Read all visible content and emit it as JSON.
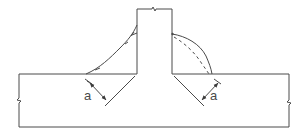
{
  "diagram": {
    "type": "fillet-weld-t-joint",
    "stroke_color": "#4a4a4a",
    "background": "#ffffff",
    "base_plate": {
      "x": 19,
      "y": 74,
      "width": 270,
      "height": 53
    },
    "web_plate": {
      "x": 137,
      "y": 9,
      "width": 35,
      "height": 65
    },
    "left_weld": {
      "profile": "concave"
    },
    "right_weld": {
      "profile": "convex",
      "theoretical_outline": "dashed"
    },
    "dimensions": {
      "left_throat_label": "a",
      "right_throat_label": "a"
    }
  }
}
